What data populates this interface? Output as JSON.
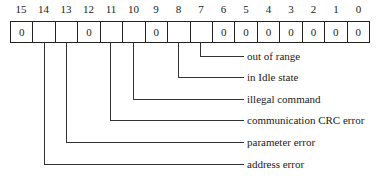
{
  "register": {
    "bit_numbers": [
      "15",
      "14",
      "13",
      "12",
      "11",
      "10",
      "9",
      "8",
      "7",
      "6",
      "5",
      "4",
      "3",
      "2",
      "1",
      "0"
    ],
    "cells": [
      "0",
      "",
      "",
      "0",
      "",
      "",
      "0",
      "",
      "",
      "0",
      "0",
      "0",
      "0",
      "0",
      "0",
      "0"
    ]
  },
  "fields": [
    {
      "bit": "7",
      "label": "out of range"
    },
    {
      "bit": "8",
      "label": "in Idle state"
    },
    {
      "bit": "10",
      "label": "illegal command"
    },
    {
      "bit": "11",
      "label": "communication CRC error"
    },
    {
      "bit": "13",
      "label": "parameter error"
    },
    {
      "bit": "14",
      "label": "address error"
    }
  ]
}
